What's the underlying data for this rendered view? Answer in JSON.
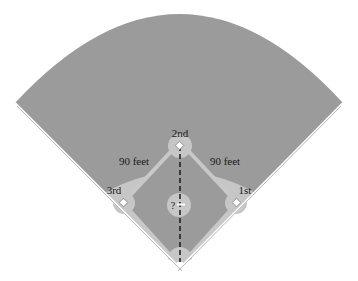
{
  "diagram": {
    "type": "baseball-field",
    "labels": {
      "second": "2nd",
      "third": "3rd",
      "first": "1st",
      "left_side": "90 feet",
      "right_side": "90 feet",
      "unknown": "?"
    },
    "colors": {
      "outfield": "#9b9b9b",
      "infield_dirt": "#c6c6c6",
      "infield_grass": "#9b9b9b",
      "base_path": "#c8c8c8",
      "foul_line": "#ffffff",
      "base": "#ffffff",
      "dashed_line": "#222222",
      "text": "#1a1a1a"
    }
  }
}
